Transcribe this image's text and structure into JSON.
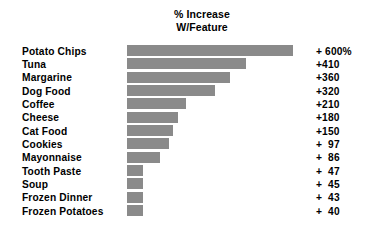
{
  "chart_data": {
    "type": "bar",
    "orientation": "horizontal",
    "title": "% Increase\nW/Feature",
    "title_lines": [
      "% Increase",
      "W/Feature"
    ],
    "xlabel": "",
    "ylabel": "",
    "grid": false,
    "legend": null,
    "xlim": [
      0,
      600
    ],
    "bar_color": "#8a8a8a",
    "categories": [
      "Potato Chips",
      "Tuna",
      "Margarine",
      "Dog Food",
      "Coffee",
      "Cheese",
      "Cat Food",
      "Cookies",
      "Mayonnaise",
      "Tooth Paste",
      "Soup",
      "Frozen Dinner",
      "Frozen Potatoes"
    ],
    "values": [
      600,
      410,
      360,
      320,
      210,
      180,
      150,
      97,
      86,
      47,
      45,
      43,
      40
    ],
    "value_labels": [
      "+ 600%",
      "+410",
      "+360",
      "+320",
      "+210",
      "+180",
      "+150",
      "+  97",
      "+  86",
      "+  47",
      "+  45",
      "+  43",
      "+  40"
    ],
    "bar_pixel_widths": [
      166,
      119,
      103,
      88,
      59,
      51,
      46,
      42,
      33,
      16,
      16,
      16,
      16
    ]
  }
}
